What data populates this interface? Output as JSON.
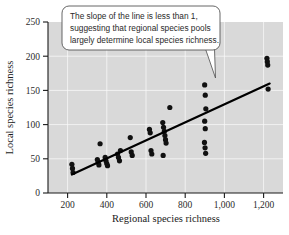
{
  "chart_data": {
    "type": "scatter",
    "title": "",
    "xlabel": "Regional species richness",
    "ylabel": "Local species richness",
    "xlim": [
      100,
      1300
    ],
    "ylim": [
      0,
      250
    ],
    "xticks": [
      200,
      400,
      600,
      800,
      1000,
      1200
    ],
    "xtick_labels": [
      "200",
      "400",
      "600",
      "800",
      "1,000",
      "1,200"
    ],
    "yticks": [
      0,
      50,
      100,
      150,
      200,
      250
    ],
    "ytick_labels": [
      "0",
      "50",
      "100",
      "150",
      "200",
      "250"
    ],
    "grid": true,
    "grid_color": "#ffffff",
    "plot_background": "#d9d9d9",
    "point_color": "#111111",
    "point_radius": 2.6,
    "legend": null,
    "series": [
      {
        "name": "Local vs regional species richness",
        "marker": "filled-circle",
        "points": [
          [
            222,
            42
          ],
          [
            225,
            36
          ],
          [
            228,
            30
          ],
          [
            352,
            49
          ],
          [
            356,
            45
          ],
          [
            360,
            41
          ],
          [
            366,
            72
          ],
          [
            392,
            52
          ],
          [
            396,
            47
          ],
          [
            400,
            43
          ],
          [
            404,
            40
          ],
          [
            455,
            57
          ],
          [
            460,
            52
          ],
          [
            465,
            47
          ],
          [
            470,
            62
          ],
          [
            520,
            81
          ],
          [
            525,
            60
          ],
          [
            530,
            55
          ],
          [
            618,
            93
          ],
          [
            622,
            88
          ],
          [
            626,
            62
          ],
          [
            630,
            57
          ],
          [
            686,
            103
          ],
          [
            690,
            96
          ],
          [
            694,
            90
          ],
          [
            697,
            84
          ],
          [
            700,
            78
          ],
          [
            703,
            73
          ],
          [
            688,
            55
          ],
          [
            722,
            125
          ],
          [
            900,
            158
          ],
          [
            903,
            143
          ],
          [
            906,
            123
          ],
          [
            900,
            105
          ],
          [
            903,
            94
          ],
          [
            899,
            74
          ],
          [
            902,
            66
          ],
          [
            905,
            58
          ],
          [
            1218,
            197
          ],
          [
            1220,
            192
          ],
          [
            1222,
            187
          ],
          [
            1224,
            152
          ]
        ]
      }
    ],
    "trendline": {
      "name": "regression-line",
      "description": "least-squares fit line with slope less than 1",
      "x_start": 222,
      "y_start": 27,
      "x_end": 1232,
      "y_end": 160,
      "color": "#000000",
      "width": 2.2
    },
    "annotations": [
      {
        "name": "slope-callout",
        "lines": [
          "The slope of the line is less than 1,",
          "suggesting that regional species pools",
          "largely determine local species richness."
        ],
        "text": "The slope of the line is less than 1, suggesting that regional species pools largely determine local species richness.",
        "points_to_x": 1040,
        "points_to_y": 150,
        "border_color": "#555555",
        "fill_color": "#ffffff"
      }
    ]
  }
}
